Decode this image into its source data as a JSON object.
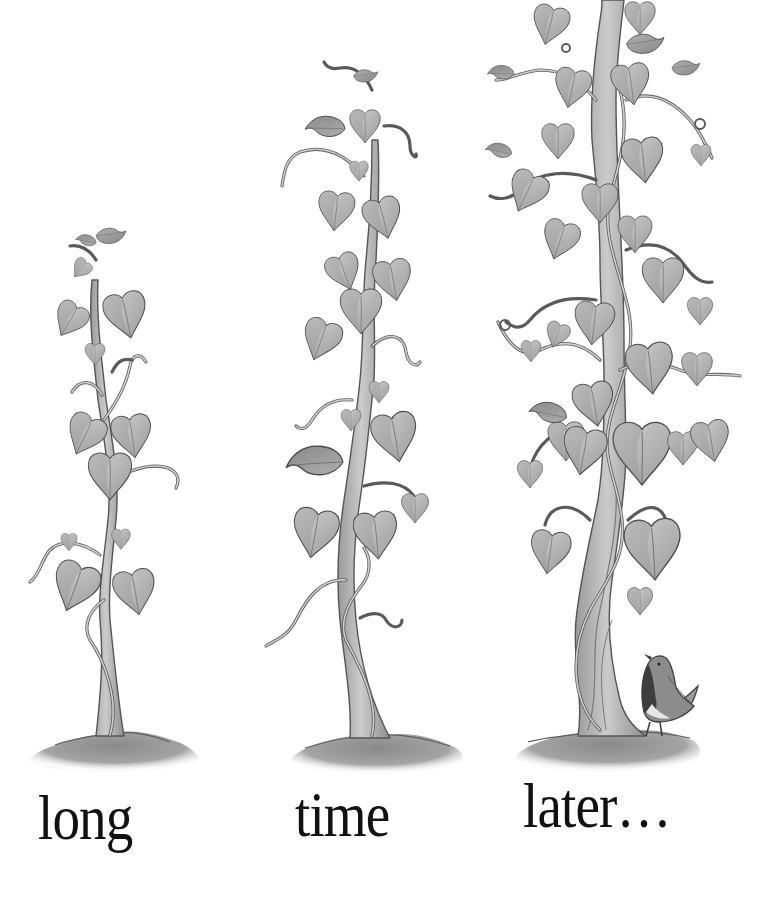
{
  "illustration": {
    "style": "grayscale watercolor picture-book illustration",
    "background_color": "#ffffff",
    "palette": {
      "leaf_light": "#c8c8c8",
      "leaf_mid": "#a9a9a9",
      "leaf_dark": "#8c8c8c",
      "stem": "#b9b9b9",
      "stem_shadow": "#8f8f8f",
      "outline": "#4a4a4a",
      "soil": "#9a9a9a",
      "soil_dark": "#7d7d7d",
      "bird_body": "#8a8a8a",
      "bird_breast": "#3e3e3e",
      "bird_belly": "#e6e6e6",
      "text": "#111111"
    },
    "plants": [
      {
        "id": "plant-1",
        "label": "small beanstalk",
        "base_x": 112,
        "base_y": 740,
        "top_y": 230
      },
      {
        "id": "plant-2",
        "label": "medium beanstalk",
        "base_x": 370,
        "base_y": 740,
        "top_y": 62
      },
      {
        "id": "plant-3",
        "label": "tall beanstalk",
        "base_x": 605,
        "base_y": 738,
        "top_y": 0
      }
    ],
    "bird": {
      "label": "small bird looking up",
      "x": 640,
      "y": 650
    }
  },
  "caption": {
    "words": [
      {
        "text": "long",
        "x": 38,
        "y": 786
      },
      {
        "text": "time",
        "x": 295,
        "y": 783
      },
      {
        "text": "later…",
        "x": 523,
        "y": 774
      }
    ]
  }
}
